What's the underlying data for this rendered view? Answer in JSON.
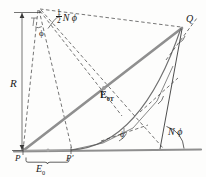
{
  "figure": {
    "name": "vector-addition-phasor-diagram",
    "background_color": "#fdfdfc",
    "line_color": "#2b2b2b",
    "vector_color": "#8c8c8c",
    "baseline_color": "#8c8c8c"
  },
  "labels": {
    "radius": "R",
    "phi_apex": "ϕ",
    "half_n_phi_numerator": "1",
    "half_n_phi_denominator": "2",
    "half_n_phi_rest": "N ϕ",
    "point_q": "Q",
    "resultant_field": "E",
    "resultant_field_subscript": "0T",
    "n_phi": "N ϕ",
    "phi_curve": "ϕ",
    "point_p": "P",
    "point_p_prime": "P′",
    "element_field": "E",
    "element_field_subscript": "0"
  },
  "geometry": {
    "apex": {
      "x": 38,
      "y": 9
    },
    "point_p": {
      "x": 23,
      "y": 151
    },
    "point_p_prime": {
      "x": 72,
      "y": 150
    },
    "point_q": {
      "x": 182,
      "y": 27
    },
    "e0t_midpoint": {
      "x": 103,
      "y": 90
    },
    "baseline_left": {
      "x": 14,
      "y": 151
    },
    "baseline_right": {
      "x": 201,
      "y": 149
    },
    "dimension_line_x": 22,
    "dimension_top_y": 12,
    "dimension_bottom_y": 151,
    "brace_left_x": 27,
    "brace_right_x": 70,
    "brace_y": 159,
    "arc_start": {
      "x": 72,
      "y": 150
    },
    "arc_end": {
      "x": 182,
      "y": 27
    },
    "angle_arc_n_phi_center": {
      "x": 160,
      "y": 149
    },
    "angle_arc_n_phi_radius": 24,
    "angle_arc_half_n_phi_center": {
      "x": 38,
      "y": 9
    },
    "angle_arc_half_n_phi_radius": 22
  }
}
